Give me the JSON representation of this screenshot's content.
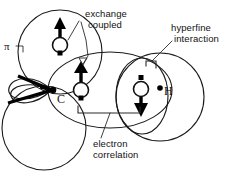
{
  "figure": {
    "background_color": "#ffffff",
    "ink_color": "#111111"
  },
  "annotations": {
    "exchange_coupled": {
      "line1": "exchange",
      "line2": "coupled"
    },
    "hyperfine_interaction": {
      "line1": "hyperfine",
      "line2": "interaction"
    },
    "electron_correlation": {
      "line1": "electron",
      "line2": "correlation"
    }
  },
  "atom_labels": {
    "carbon": "C",
    "hydrogen": "H",
    "pi_orbital": "π"
  },
  "spins": [
    {
      "name": "upper-left-spin",
      "direction": "up",
      "label": ""
    },
    {
      "name": "central-spin",
      "direction": "up",
      "label": ""
    },
    {
      "name": "right-spin",
      "direction": "down",
      "label": ""
    }
  ],
  "orbitals": [
    {
      "name": "upper-left-circle",
      "shape": "circle"
    },
    {
      "name": "lower-left-circle",
      "shape": "circle"
    },
    {
      "name": "central-ellipse",
      "shape": "ellipse"
    },
    {
      "name": "right-large-circle",
      "shape": "circle"
    },
    {
      "name": "right-inner-ellipse",
      "shape": "ellipse"
    },
    {
      "name": "pi-lobe-left",
      "shape": "lobe"
    }
  ]
}
